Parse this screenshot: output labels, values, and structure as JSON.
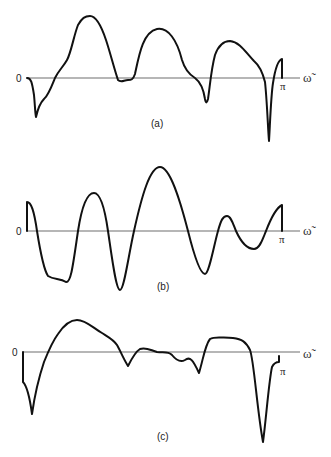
{
  "figure": {
    "panels": [
      {
        "id": "a",
        "caption": "(a)",
        "origin_label": "0",
        "end_label": "π",
        "axis_label": "ω̃"
      },
      {
        "id": "b",
        "caption": "(b)",
        "origin_label": "0",
        "end_label": "π",
        "axis_label": "ω̃"
      },
      {
        "id": "c",
        "caption": "(c)",
        "origin_label": "0",
        "end_label": "π",
        "axis_label": "ω̃"
      }
    ]
  }
}
